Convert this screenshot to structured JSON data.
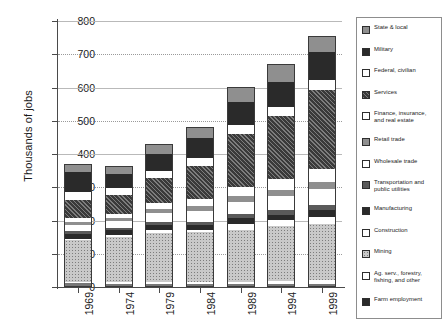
{
  "chart_data": {
    "type": "bar",
    "stacked": true,
    "title": "",
    "xlabel": "",
    "ylabel": "Thousands of jobs",
    "ylim": [
      0,
      800
    ],
    "ytick_step": 100,
    "yticks": [
      "800",
      "700",
      "600",
      "500",
      "400",
      "300",
      "200",
      "100",
      "0"
    ],
    "grid": true,
    "legend_position": "right",
    "categories": [
      "1969",
      "1974",
      "1979",
      "1984",
      "1989",
      "1994",
      "1999"
    ],
    "series": [
      {
        "name": "Farm employment",
        "pattern": "f-grayflat",
        "values": [
          12,
          10,
          9,
          8,
          8,
          8,
          8
        ]
      },
      {
        "name": "Ag. serv., forestry, fishing, and other",
        "pattern": "f-white",
        "values": [
          3,
          4,
          5,
          6,
          8,
          10,
          12
        ]
      },
      {
        "name": "Mining",
        "pattern": "f-dotlight",
        "values": [
          125,
          135,
          148,
          150,
          155,
          165,
          170
        ]
      },
      {
        "name": "Construction",
        "pattern": "f-white",
        "values": [
          5,
          6,
          9,
          8,
          20,
          18,
          22
        ]
      },
      {
        "name": "Manufacturing",
        "pattern": "f-vdark",
        "values": [
          15,
          15,
          16,
          15,
          16,
          17,
          20
        ]
      },
      {
        "name": "Transportation and public utilities",
        "pattern": "f-dotdark",
        "values": [
          8,
          8,
          10,
          10,
          12,
          14,
          16
        ]
      },
      {
        "name": "Wholesale trade",
        "pattern": "f-white",
        "values": [
          20,
          20,
          26,
          32,
          38,
          42,
          48
        ]
      },
      {
        "name": "Retail trade",
        "pattern": "f-dotmid",
        "values": [
          8,
          9,
          12,
          14,
          16,
          18,
          20
        ]
      },
      {
        "name": "Finance, insurance, and real estate",
        "pattern": "f-white",
        "values": [
          12,
          14,
          18,
          22,
          28,
          32,
          38
        ]
      },
      {
        "name": "Services",
        "pattern": "f-hatch",
        "values": [
          55,
          56,
          75,
          100,
          160,
          190,
          240
        ]
      },
      {
        "name": "Federal, civilian",
        "pattern": "f-white",
        "values": [
          22,
          20,
          22,
          24,
          26,
          26,
          28
        ]
      },
      {
        "name": "Military",
        "pattern": "f-vdark",
        "values": [
          60,
          42,
          50,
          58,
          70,
          78,
          84
        ]
      },
      {
        "name": "State & local",
        "pattern": "f-dotmid",
        "values": [
          25,
          26,
          30,
          33,
          45,
          52,
          48
        ]
      }
    ],
    "totals": [
      370,
      340,
      430,
      475,
      602,
      645,
      750
    ]
  },
  "legend": {
    "entries": [
      {
        "label": "State & local",
        "pattern": "f-dotmid"
      },
      {
        "label": "Military",
        "pattern": "f-vdark"
      },
      {
        "label": "Federal, civilian",
        "pattern": "f-white"
      },
      {
        "label": "Services",
        "pattern": "f-hatch"
      },
      {
        "label": "Finance, insurance, and real estate",
        "pattern": "f-white"
      },
      {
        "label": "Retail trade",
        "pattern": "f-dotmid"
      },
      {
        "label": "Wholesale trade",
        "pattern": "f-white"
      },
      {
        "label": "Transportation and public utilities",
        "pattern": "f-dotdark"
      },
      {
        "label": "Manufacturing",
        "pattern": "f-vdark"
      },
      {
        "label": "Construction",
        "pattern": "f-white"
      },
      {
        "label": "Mining",
        "pattern": "f-dotlight"
      },
      {
        "label": "Ag. serv., forestry, fishing, and other",
        "pattern": "f-white"
      },
      {
        "label": "Farm employment",
        "pattern": "f-vdark"
      }
    ]
  },
  "colors": {
    "axis": "#4a4a4a",
    "gridline": "#b9b9b9",
    "outline": "#3a3a3a",
    "text": "#1a1a1a"
  }
}
